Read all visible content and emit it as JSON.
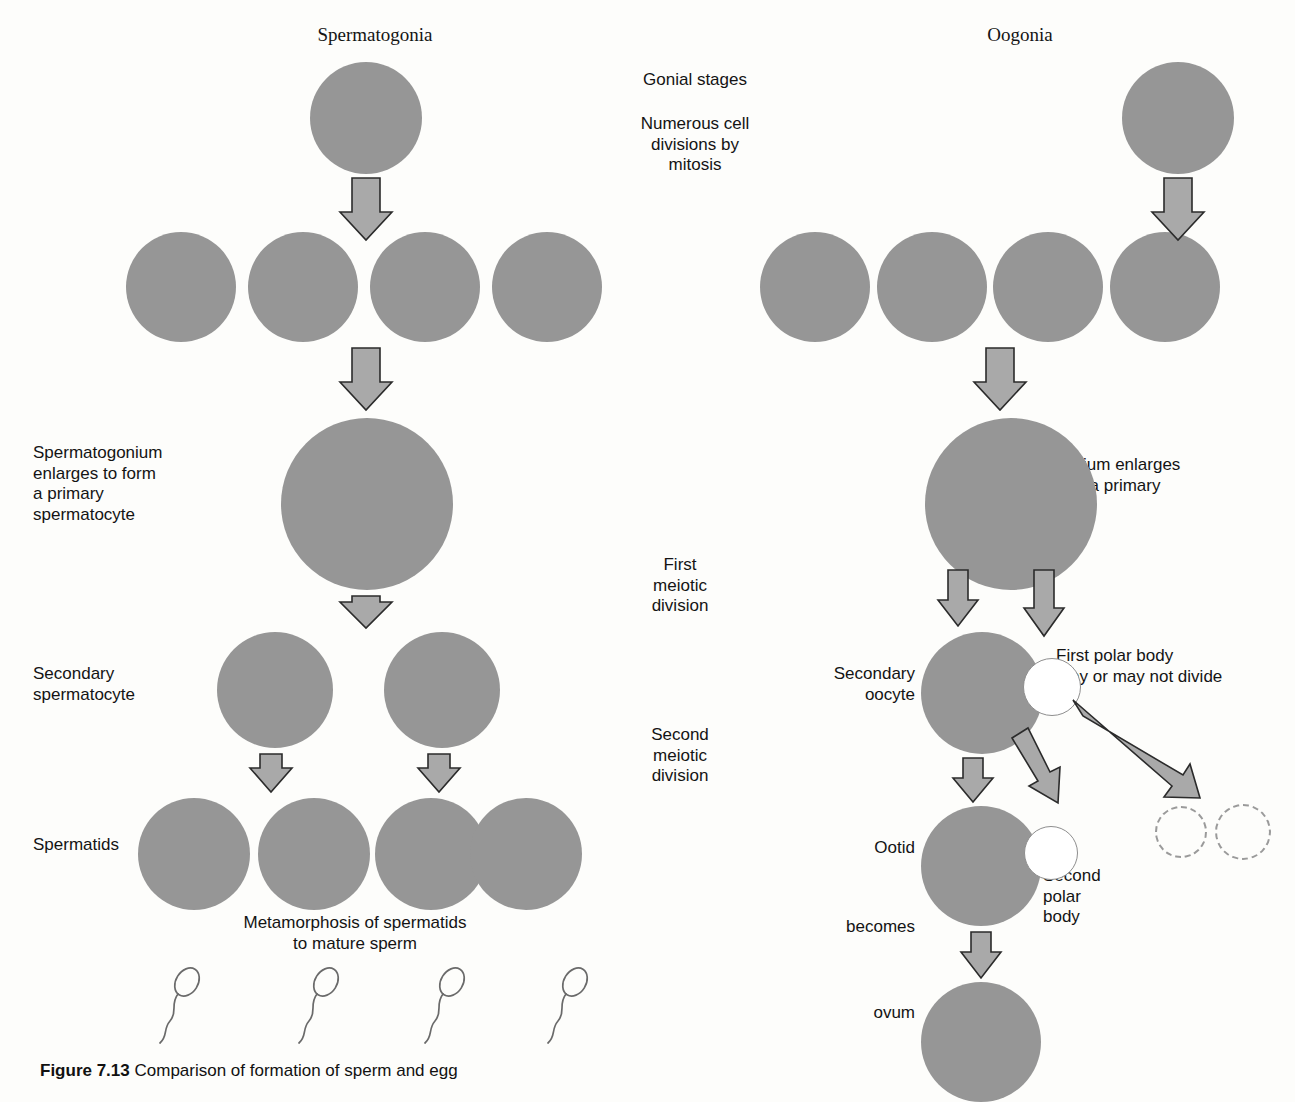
{
  "figure": {
    "caption_label": "Figure 7.13",
    "caption_text": "Comparison of formation of sperm and egg",
    "title_left": "Spermatogonia",
    "title_right": "Oogonia"
  },
  "center_labels": {
    "gonial_stages": "Gonial stages",
    "numerous_divisions": "Numerous cell\ndivisions by\nmitosis",
    "first_meiotic": "First\nmeiotic\ndivision",
    "second_meiotic": "Second\nmeiotic\ndivision"
  },
  "left_labels": {
    "spermatogonium_enlarges": "Spermatogonium\nenlarges to form\na primary\nspermatocyte",
    "secondary_spermatocyte": "Secondary\nspermatocyte",
    "spermatids": "Spermatids",
    "metamorphosis": "Metamorphosis of spermatids\nto mature sperm"
  },
  "right_labels": {
    "oogonium_enlarges": "Oogonium enlarges\nto form a primary\noocyte",
    "secondary_oocyte": "Secondary\noocyte",
    "first_polar_body": "First polar body\n  may or may not divide",
    "ootid": "Ootid",
    "second_polar_body": "Second\npolar\nbody",
    "becomes": "becomes",
    "ovum": "ovum"
  },
  "colors": {
    "cell_fill": "#969696",
    "arrow_fill": "#a9a9a9",
    "arrow_stroke": "#2b2b2b",
    "outline": "#8e8e8e",
    "text": "#141414",
    "background": "#fdfdfb"
  },
  "diagram_data": {
    "left_column_name": "Spermatogenesis",
    "right_column_name": "Oogenesis",
    "stages": [
      {
        "stage": "gonial",
        "left_cells": 1,
        "right_cells": 1,
        "note": "Gonial stages"
      },
      {
        "stage": "mitotic-products",
        "left_cells": 4,
        "right_cells": 4,
        "note": "Numerous cell divisions by mitosis"
      },
      {
        "stage": "primary",
        "left_cells": 1,
        "right_cells": 1,
        "note": "Enlarged primary spermatocyte / oocyte"
      },
      {
        "stage": "secondary",
        "left_cells": 2,
        "right_cells": 1,
        "polar_bodies": 1,
        "note": "First meiotic division"
      },
      {
        "stage": "final",
        "left_cells": 4,
        "right_cells": 1,
        "polar_bodies": 3,
        "note": "Second meiotic division"
      },
      {
        "stage": "mature",
        "left_cells": 4,
        "left_form": "sperm",
        "right_cells": 1,
        "right_form": "ovum"
      }
    ]
  }
}
